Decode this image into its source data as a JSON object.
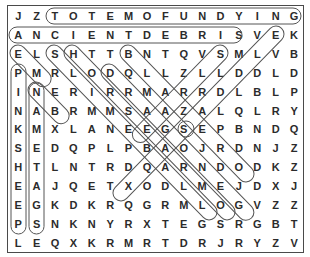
{
  "puzzle": {
    "columns": 16,
    "rows": [
      [
        "J",
        "Z",
        "T",
        "O",
        "T",
        "E",
        "M",
        "O",
        "F",
        "U",
        "N",
        "D",
        "Y",
        "I",
        "N",
        "G"
      ],
      [
        "A",
        "N",
        "C",
        "I",
        "E",
        "N",
        "T",
        "D",
        "E",
        "B",
        "R",
        "I",
        "S",
        "V",
        "E",
        "K"
      ],
      [
        "E",
        "L",
        "S",
        "H",
        "T",
        "T",
        "B",
        "N",
        "T",
        "Q",
        "V",
        "S",
        "M",
        "L",
        "V",
        "B"
      ],
      [
        "P",
        "M",
        "R",
        "L",
        "O",
        "D",
        "Q",
        "L",
        "L",
        "Z",
        "L",
        "L",
        "D",
        "D",
        "L",
        "D"
      ],
      [
        "I",
        "N",
        "E",
        "R",
        "I",
        "R",
        "R",
        "M",
        "A",
        "R",
        "R",
        "D",
        "L",
        "B",
        "L",
        "P"
      ],
      [
        "N",
        "A",
        "B",
        "R",
        "M",
        "M",
        "S",
        "A",
        "A",
        "Z",
        "A",
        "L",
        "Q",
        "L",
        "R",
        "Y"
      ],
      [
        "K",
        "M",
        "X",
        "L",
        "A",
        "N",
        "E",
        "E",
        "G",
        "S",
        "E",
        "P",
        "B",
        "N",
        "D",
        "Q"
      ],
      [
        "S",
        "E",
        "D",
        "Q",
        "P",
        "L",
        "P",
        "B",
        "A",
        "O",
        "J",
        "R",
        "D",
        "N",
        "J",
        "Z"
      ],
      [
        "H",
        "T",
        "L",
        "N",
        "T",
        "R",
        "D",
        "Q",
        "A",
        "R",
        "N",
        "D",
        "O",
        "D",
        "K",
        "Z"
      ],
      [
        "E",
        "A",
        "J",
        "Q",
        "E",
        "T",
        "X",
        "O",
        "D",
        "L",
        "M",
        "E",
        "J",
        "D",
        "X",
        "J"
      ],
      [
        "E",
        "G",
        "K",
        "D",
        "K",
        "R",
        "Q",
        "G",
        "R",
        "M",
        "L",
        "O",
        "G",
        "V",
        "Z",
        "Z"
      ],
      [
        "P",
        "S",
        "N",
        "K",
        "N",
        "Y",
        "R",
        "X",
        "T",
        "E",
        "G",
        "S",
        "R",
        "G",
        "B",
        "T"
      ],
      [
        "L",
        "E",
        "Q",
        "X",
        "K",
        "R",
        "M",
        "R",
        "T",
        "D",
        "R",
        "J",
        "R",
        "Y",
        "Z",
        "V"
      ]
    ],
    "found_words": [
      {
        "word": "TOTEMOFUNDYING",
        "start": [
          0,
          2
        ],
        "end": [
          0,
          15
        ]
      },
      {
        "word": "ANCIENTDEBRIS",
        "start": [
          1,
          0
        ],
        "end": [
          1,
          12
        ]
      },
      {
        "word": "PINKSHEEP",
        "start": [
          3,
          0
        ],
        "end": [
          11,
          0
        ]
      },
      {
        "word": "NAMETAGS",
        "start": [
          4,
          1
        ],
        "end": [
          11,
          1
        ]
      }
    ]
  }
}
